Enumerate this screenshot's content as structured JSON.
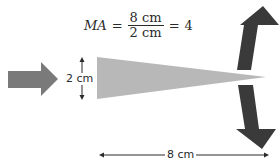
{
  "formula": {
    "lhs": "MA",
    "equals": "=",
    "numerator": "8 cm",
    "denominator": "2 cm",
    "equals2": "=",
    "result": "4"
  },
  "labels": {
    "wedge_height": "2 cm",
    "wedge_length": "8 cm"
  },
  "colors": {
    "input_arrow": "#7a7a7a",
    "wedge": "#b8b8b8",
    "output_arrows": "#3a3a3a",
    "dimension_lines": "#2a2a2a"
  },
  "elements": {
    "input_force_arrow": "right-arrow",
    "wedge": "triangle-wedge",
    "output_force_arrow_up": "up-arrow",
    "output_force_arrow_down": "down-arrow",
    "height_dimension": "vertical-double-arrow",
    "length_dimension": "horizontal-double-arrow"
  }
}
